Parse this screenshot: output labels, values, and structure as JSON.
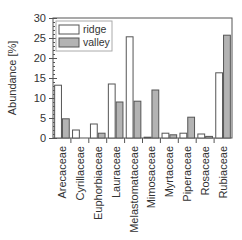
{
  "chart_data": {
    "type": "bar",
    "title": "",
    "xlabel": "",
    "ylabel": "Abundance [%]",
    "ylim": [
      0,
      30
    ],
    "yticks": [
      0,
      5,
      10,
      15,
      20,
      25,
      30
    ],
    "grid": false,
    "legend_position": "upper-left",
    "categories": [
      "Arecaceae",
      "Cyrillaceae",
      "Euphorbiaceae",
      "Lauraceae",
      "Melastomataceae",
      "Mimosaceae",
      "Myrtaceae",
      "Piperaceae",
      "Rosaceae",
      "Rubiaceae"
    ],
    "series": [
      {
        "name": "ridge",
        "color": "#ffffff",
        "values": [
          13.2,
          2.0,
          3.5,
          13.5,
          25.3,
          0.2,
          1.2,
          1.2,
          1.0,
          16.3
        ]
      },
      {
        "name": "valley",
        "color": "#b3b3b3",
        "values": [
          4.8,
          0.0,
          1.2,
          9.0,
          9.2,
          12.0,
          0.8,
          5.2,
          0.4,
          25.7
        ]
      }
    ]
  },
  "colors": {
    "axis": "#555555",
    "bar_edge": "#555555",
    "ridge_fill": "#ffffff",
    "valley_fill": "#b3b3b3"
  }
}
